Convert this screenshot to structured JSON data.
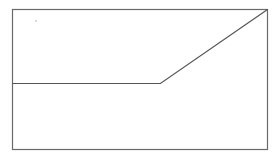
{
  "chart_data": {
    "type": "line",
    "title": "",
    "xlabel": "",
    "ylabel": "",
    "x": [
      0,
      0.58,
      1.0
    ],
    "series": [
      {
        "name": "",
        "values": [
          0,
          0,
          0.55
        ],
        "color": "#555555"
      }
    ],
    "xlim": [
      0,
      1
    ],
    "ylim": [
      -0.49,
      0.55
    ],
    "grid": false,
    "legend": "none",
    "frame_color": "#666666"
  }
}
